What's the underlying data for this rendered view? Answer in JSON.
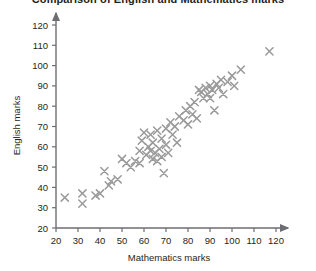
{
  "chart_data": {
    "type": "scatter",
    "title": "Comparison of English and Mathematics marks",
    "xlabel": "Mathematics marks",
    "ylabel": "English marks",
    "xlim": [
      20,
      120
    ],
    "ylim": [
      20,
      120
    ],
    "xticks": [
      20,
      30,
      40,
      50,
      60,
      70,
      80,
      90,
      100,
      110,
      120
    ],
    "yticks": [
      20,
      30,
      40,
      50,
      60,
      70,
      80,
      90,
      100,
      110,
      120
    ],
    "grid": false,
    "legend": false,
    "marker": "x",
    "marker_color": "#9a9a9a",
    "axis_color": "#6d6e71",
    "points": [
      [
        24,
        35
      ],
      [
        32,
        37
      ],
      [
        32,
        32
      ],
      [
        38,
        36
      ],
      [
        40,
        37
      ],
      [
        42,
        48
      ],
      [
        44,
        41
      ],
      [
        45,
        43
      ],
      [
        48,
        44
      ],
      [
        50,
        54
      ],
      [
        52,
        52
      ],
      [
        54,
        50
      ],
      [
        56,
        53
      ],
      [
        58,
        58
      ],
      [
        58,
        52
      ],
      [
        59,
        63
      ],
      [
        60,
        67
      ],
      [
        61,
        56
      ],
      [
        62,
        60
      ],
      [
        63,
        58
      ],
      [
        63,
        66
      ],
      [
        64,
        54
      ],
      [
        64,
        62
      ],
      [
        65,
        57
      ],
      [
        66,
        53
      ],
      [
        66,
        68
      ],
      [
        67,
        59
      ],
      [
        68,
        55
      ],
      [
        68,
        64
      ],
      [
        69,
        47
      ],
      [
        70,
        61
      ],
      [
        70,
        69
      ],
      [
        71,
        57
      ],
      [
        72,
        72
      ],
      [
        73,
        66
      ],
      [
        74,
        70
      ],
      [
        75,
        62
      ],
      [
        76,
        75
      ],
      [
        78,
        73
      ],
      [
        79,
        78
      ],
      [
        80,
        71
      ],
      [
        81,
        80
      ],
      [
        82,
        76
      ],
      [
        83,
        82
      ],
      [
        84,
        74
      ],
      [
        85,
        88
      ],
      [
        86,
        87
      ],
      [
        87,
        84
      ],
      [
        88,
        89
      ],
      [
        89,
        86
      ],
      [
        90,
        90
      ],
      [
        90,
        84
      ],
      [
        91,
        88
      ],
      [
        92,
        78
      ],
      [
        93,
        91
      ],
      [
        94,
        89
      ],
      [
        95,
        93
      ],
      [
        96,
        86
      ],
      [
        98,
        92
      ],
      [
        100,
        95
      ],
      [
        101,
        90
      ],
      [
        104,
        98
      ],
      [
        117,
        107
      ]
    ]
  }
}
